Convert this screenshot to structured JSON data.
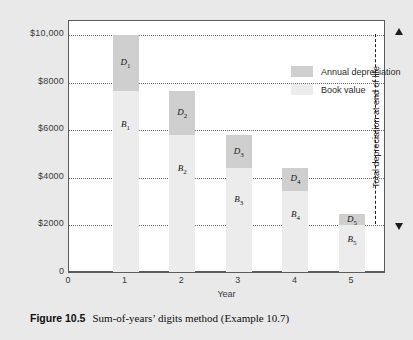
{
  "caption": {
    "label": "Figure 10.5",
    "text": "Sum-of-years’ digits method (Example 10.7)"
  },
  "colors": {
    "depreciation_swatch": "#cfcfcf",
    "book_value_swatch": "#ececec",
    "frame": "#5b5b5b",
    "gridline": "#6d6d6d",
    "page_background": "#e9e9e9",
    "plot_background": "#ffffff"
  },
  "annotation": {
    "text": "Total depreciation at end of life",
    "from_value": 10000,
    "to_value": 2000
  },
  "chart_data": {
    "type": "bar",
    "title": "",
    "subtitle": "",
    "xlabel": "Year",
    "ylabel": "",
    "categories": [
      "1",
      "2",
      "3",
      "4",
      "5"
    ],
    "x": [
      1,
      2,
      3,
      4,
      5
    ],
    "xlim": [
      0,
      5.6
    ],
    "ylim": [
      0,
      10600
    ],
    "xticks": [
      "0",
      "1",
      "2",
      "3",
      "4",
      "5"
    ],
    "yticks": [
      0,
      2000,
      4000,
      6000,
      8000,
      10000
    ],
    "ytick_labels": [
      "0",
      "$2000",
      "$4000",
      "$6000",
      "$8000",
      "$10,000"
    ],
    "grid": true,
    "grid_axis": "y",
    "legend_position": "inside-top-right",
    "stacked": true,
    "series": [
      {
        "name": "Annual depreciation",
        "key": "depreciation",
        "color": "#cfcfcf",
        "values": [
          2333,
          1867,
          1400,
          933,
          467
        ],
        "point_labels": [
          "D1",
          "D2",
          "D3",
          "D4",
          "D5"
        ]
      },
      {
        "name": "Book value",
        "key": "book_value",
        "color": "#ececec",
        "values": [
          7667,
          5800,
          4400,
          3467,
          2000
        ],
        "point_labels": [
          "B1",
          "B2",
          "B3",
          "B4",
          "B5"
        ]
      }
    ],
    "bar_tops": [
      10000,
      7667,
      5800,
      4400,
      2467
    ],
    "legend": [
      {
        "label": "Annual depreciation",
        "color": "#cfcfcf"
      },
      {
        "label": "Book value",
        "color": "#ececec"
      }
    ],
    "bars": [
      {
        "year": "1",
        "top": 10000,
        "split": 7667,
        "bottom": 0,
        "dep_label_base": "D",
        "dep_label_sub": "1",
        "book_label_base": "B",
        "book_label_sub": "1"
      },
      {
        "year": "2",
        "top": 7667,
        "split": 5800,
        "bottom": 0,
        "dep_label_base": "D",
        "dep_label_sub": "2",
        "book_label_base": "B",
        "book_label_sub": "2"
      },
      {
        "year": "3",
        "top": 5800,
        "split": 4400,
        "bottom": 0,
        "dep_label_base": "D",
        "dep_label_sub": "3",
        "book_label_base": "B",
        "book_label_sub": "3"
      },
      {
        "year": "4",
        "top": 4400,
        "split": 3467,
        "bottom": 0,
        "dep_label_base": "D",
        "dep_label_sub": "4",
        "book_label_base": "B",
        "book_label_sub": "4"
      },
      {
        "year": "5",
        "top": 2467,
        "split": 2000,
        "bottom": 0,
        "dep_label_base": "D",
        "dep_label_sub": "5",
        "book_label_base": "B",
        "book_label_sub": "5"
      }
    ]
  }
}
